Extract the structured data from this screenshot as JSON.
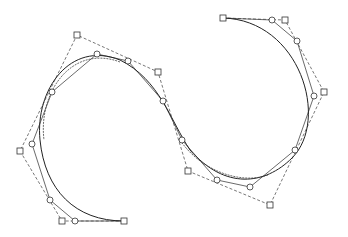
{
  "diagram": {
    "title": "",
    "colors": {
      "background": "#ffffff",
      "stroke": "#333333",
      "dashed": "#555555",
      "curve": "#222222"
    },
    "control_polygon_dashed": [
      [
        223,
        18
      ],
      [
        285,
        20
      ],
      [
        324,
        92
      ],
      [
        270,
        205
      ],
      [
        188,
        171
      ],
      [
        158,
        72
      ],
      [
        77,
        35
      ],
      [
        20,
        151
      ],
      [
        62,
        221
      ],
      [
        124,
        221
      ]
    ],
    "control_polygon_solid": [
      [
        223,
        18
      ],
      [
        272,
        20
      ],
      [
        297,
        41
      ],
      [
        314,
        96
      ],
      [
        295,
        150
      ],
      [
        250,
        187
      ],
      [
        217,
        180
      ],
      [
        182,
        140
      ],
      [
        163,
        101
      ],
      [
        128,
        61
      ],
      [
        97,
        54
      ],
      [
        52,
        92
      ],
      [
        32,
        144
      ],
      [
        50,
        200
      ],
      [
        75,
        221
      ],
      [
        124,
        221
      ]
    ],
    "curve_path": "M223,18 C300,20 330,120 292,158 C265,185 225,190 190,150 C170,120 160,80 120,60 C70,40 35,90 40,140 C45,190 75,221 124,221",
    "curve_path_dashed": "M120,62 C72,44 38,92 44,140 M180,140 C200,170 240,185 268,175"
  }
}
